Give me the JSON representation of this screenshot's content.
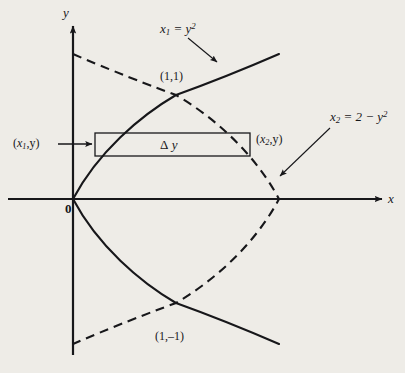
{
  "figure": {
    "name": "region-between-two-parabolas-with-horizontal-strip",
    "background_color": "#eeece7",
    "ink_color": "#17171a"
  },
  "axes": {
    "x_label": "x",
    "y_label": "y",
    "origin_label": "0",
    "origin_px": {
      "x": 73,
      "y": 199
    },
    "unit_px": 103,
    "x_axis_y_px": 199,
    "y_axis_x_px": 73
  },
  "curves": {
    "solid": {
      "label_text_parts": {
        "var": "x",
        "sub": "2",
        "rhs": " = 2 − y",
        "sup": "2"
      },
      "label_full": "x₂ = 2 − y²",
      "style": "solid",
      "equation": "x = y^2"
    },
    "dashed": {
      "label_text_parts": {
        "var": "x",
        "sub": "1",
        "rhs": " = y",
        "sup": "2"
      },
      "label_full": "x₁ = y²",
      "style": "dashed",
      "equation": "x = 2 - y^2"
    }
  },
  "points": {
    "upper": "(1,1)",
    "lower": "(1,–1)"
  },
  "strip": {
    "left_label": {
      "open": "(",
      "var": "x",
      "sub": "1",
      "rest": ",y)"
    },
    "left_label_full": "(x₁,y)",
    "right_label": {
      "open": "(",
      "var": "x",
      "sub": "2",
      "rest": ",y)"
    },
    "right_label_full": "(x₂,y)",
    "thickness_label": {
      "delta": "Δ",
      "var": " y"
    },
    "thickness_label_full": "Δy",
    "rect_px": {
      "left": 95,
      "top": 133,
      "right": 250,
      "bottom": 156
    }
  }
}
